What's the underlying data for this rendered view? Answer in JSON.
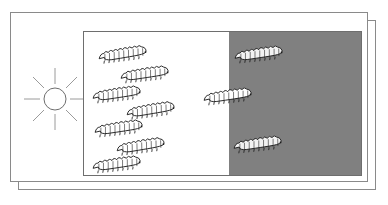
{
  "diagram": {
    "frames": {
      "back_frame_name": "back-slide-frame",
      "front_frame_name": "front-slide-frame"
    },
    "light_source": {
      "icon": "sun-icon",
      "ray_count": 8,
      "label": ""
    },
    "panel": {
      "light_zone": {
        "name": "light-zone",
        "fill": "#ffffff",
        "organism_count": 7
      },
      "dark_zone": {
        "name": "dark-zone",
        "fill": "#808080",
        "organism_count": 2
      },
      "boundary_x_fraction": 0.52,
      "border_color": "#6e6e6e"
    },
    "organisms": {
      "icon": "caterpillar-icon",
      "light_zone_items": [
        {
          "x": 12,
          "y": 14,
          "rot": -4,
          "size": "md"
        },
        {
          "x": 34,
          "y": 34,
          "rot": -3,
          "size": "md"
        },
        {
          "x": 6,
          "y": 54,
          "rot": -3,
          "size": "md"
        },
        {
          "x": 40,
          "y": 70,
          "rot": -4,
          "size": "md"
        },
        {
          "x": 8,
          "y": 88,
          "rot": -3,
          "size": "md"
        },
        {
          "x": 30,
          "y": 106,
          "rot": -4,
          "size": "md"
        },
        {
          "x": 6,
          "y": 124,
          "rot": -3,
          "size": "md"
        }
      ],
      "boundary_items": [
        {
          "x": 117,
          "y": 56,
          "rot": -3,
          "size": "md"
        }
      ],
      "dark_zone_items": [
        {
          "x": 63,
          "y": 14,
          "rot": -3,
          "size": "md"
        },
        {
          "x": 62,
          "y": 104,
          "rot": -3,
          "size": "md"
        }
      ]
    },
    "colors": {
      "shade_gray": "#808080",
      "frame_line": "#8a8a8a",
      "panel_line": "#6e6e6e",
      "body_outline": "#1a1a1a",
      "body_fill_light": "#ffffff",
      "body_fill_dark": "#f2f2f2",
      "sun_line": "#9a9a9a",
      "background": "#ffffff"
    }
  }
}
